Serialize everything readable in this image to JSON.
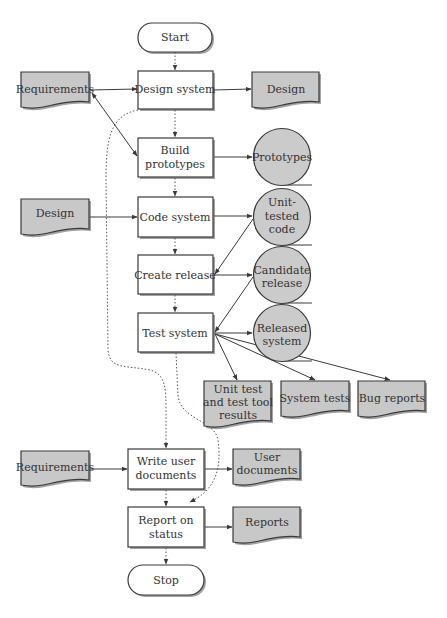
{
  "diagram": {
    "type": "flowchart",
    "colors": {
      "process_fill": "#ffffff",
      "document_fill": "#c8c8c8",
      "store_fill": "#cbcbcb",
      "stroke": "#3a3a3a",
      "text": "#333333"
    },
    "terminals": {
      "start": "Start",
      "stop": "Stop"
    },
    "processes": {
      "design_system": "Design system",
      "build_prototypes": [
        "Build",
        "prototypes"
      ],
      "code_system": "Code system",
      "create_release": "Create release",
      "test_system": "Test system",
      "write_user_documents": [
        "Write user",
        "documents"
      ],
      "report_on_status": [
        "Report on",
        "status"
      ]
    },
    "documents": {
      "requirements_top": "Requirements",
      "design_output": "Design",
      "design_input": "Design",
      "unit_test_results": [
        "Unit test",
        "and test tool",
        "results"
      ],
      "system_tests": "System tests",
      "bug_reports": "Bug reports",
      "requirements_bottom": "Requirements",
      "user_documents": [
        "User",
        "documents"
      ],
      "reports": "Reports"
    },
    "stores": {
      "prototypes": "Prototypes",
      "unit_tested_code": [
        "Unit-",
        "tested",
        "code"
      ],
      "candidate_release": [
        "Candidate",
        "release"
      ],
      "released_system": [
        "Released",
        "system"
      ]
    },
    "edges": [
      {
        "from": "Start",
        "to": "Design system",
        "style": "dotted"
      },
      {
        "from": "Requirements",
        "to": "Design system",
        "style": "solid"
      },
      {
        "from": "Design system",
        "to": "Design",
        "style": "solid"
      },
      {
        "from": "Design system",
        "to": "Build prototypes",
        "style": "dotted"
      },
      {
        "from": "Requirements",
        "to": "Build prototypes",
        "style": "solid",
        "bidirectional": true
      },
      {
        "from": "Build prototypes",
        "to": "Prototypes",
        "style": "solid"
      },
      {
        "from": "Build prototypes",
        "to": "Code system",
        "style": "dotted"
      },
      {
        "from": "Design",
        "to": "Code system",
        "style": "solid"
      },
      {
        "from": "Code system",
        "to": "Unit-tested code",
        "style": "solid"
      },
      {
        "from": "Code system",
        "to": "Create release",
        "style": "dotted"
      },
      {
        "from": "Unit-tested code",
        "to": "Create release",
        "style": "solid"
      },
      {
        "from": "Create release",
        "to": "Candidate release",
        "style": "solid"
      },
      {
        "from": "Create release",
        "to": "Test system",
        "style": "dotted"
      },
      {
        "from": "Candidate release",
        "to": "Test system",
        "style": "solid"
      },
      {
        "from": "Test system",
        "to": "Released system",
        "style": "solid"
      },
      {
        "from": "Test system",
        "to": "Unit test and test tool results",
        "style": "solid"
      },
      {
        "from": "Test system",
        "to": "System tests",
        "style": "solid"
      },
      {
        "from": "Test system",
        "to": "Bug reports",
        "style": "solid"
      },
      {
        "from": "Design system",
        "to": "Write user documents",
        "style": "dotted"
      },
      {
        "from": "Requirements",
        "to": "Write user documents",
        "style": "solid"
      },
      {
        "from": "Write user documents",
        "to": "User documents",
        "style": "solid"
      },
      {
        "from": "Test system",
        "to": "Report on status",
        "style": "dotted"
      },
      {
        "from": "Write user documents",
        "to": "Report on status",
        "style": "dotted"
      },
      {
        "from": "Report on status",
        "to": "Reports",
        "style": "solid"
      },
      {
        "from": "Report on status",
        "to": "Stop",
        "style": "dotted"
      }
    ]
  }
}
